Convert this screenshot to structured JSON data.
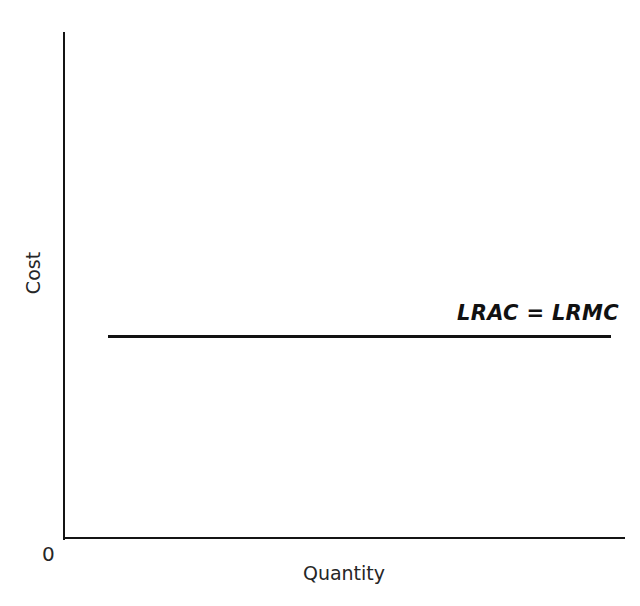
{
  "chart_data": {
    "type": "line",
    "title": "",
    "subtitle": "",
    "xlabel": "Quantity",
    "ylabel": "Cost",
    "origin_label": "0",
    "grid": false,
    "legend_position": "inline-annotation",
    "axis_ticks": {
      "x": [],
      "y": []
    },
    "xlim": [
      0,
      100
    ],
    "ylim": [
      0,
      100
    ],
    "series": [
      {
        "name": "LRAC = LRMC",
        "label": "LRAC = LRMC",
        "style": "solid",
        "color": "#111111",
        "x": [
          8,
          97
        ],
        "values": [
          40,
          40
        ],
        "description": "Constant long-run average cost equal to long-run marginal cost (constant returns to scale)"
      }
    ],
    "annotations": [
      {
        "text": "LRAC = LRMC",
        "x": 70,
        "y": 47,
        "style": "bold-italic"
      }
    ]
  },
  "axes": {
    "y_title": "Cost",
    "x_title": "Quantity",
    "origin": "0"
  },
  "curve": {
    "label": "LRAC = LRMC"
  },
  "colors": {
    "line": "#111111",
    "axis": "#141414",
    "text": "#262626",
    "background": "#ffffff"
  }
}
